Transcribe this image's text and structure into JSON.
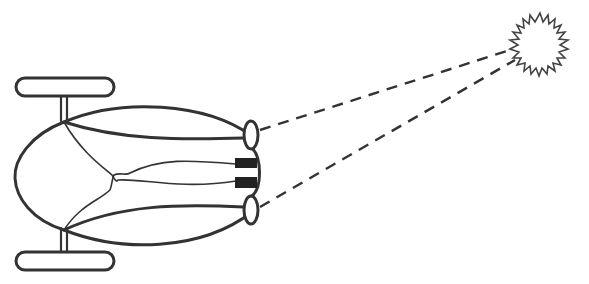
{
  "diagram": {
    "colors": {
      "stroke": "#333333",
      "fill_dark": "#222222",
      "background": "#ffffff"
    },
    "elements": {
      "body": "oval-body",
      "wheels": [
        "top-wheel",
        "bottom-wheel"
      ],
      "sensors": [
        "top-eye",
        "bottom-eye"
      ],
      "receptors": [
        "top-receptor",
        "bottom-receptor"
      ],
      "light_source": "star-light",
      "sight_lines": [
        "top-sight-line",
        "bottom-sight-line"
      ]
    }
  }
}
